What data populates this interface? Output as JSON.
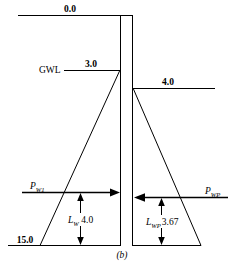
{
  "figure": {
    "caption": "(b)",
    "levels": {
      "ground_surface": "0.0",
      "gwl_label": "GWL",
      "gwl_level": "3.0",
      "dredge_level": "4.0",
      "base_level": "15.0"
    },
    "forces": {
      "left_force_symbol": "P",
      "left_force_subscript": "W1",
      "right_force_symbol": "P",
      "right_force_subscript": "WP"
    },
    "dimensions": {
      "left_lever_symbol": "L",
      "left_lever_subscript": "W",
      "left_lever_value": "4.0",
      "right_lever_symbol": "L",
      "right_lever_subscript": "WP",
      "right_lever_value": "3.67"
    },
    "colors": {
      "line": "#000000",
      "background": "#ffffff",
      "text": "#000000"
    }
  }
}
